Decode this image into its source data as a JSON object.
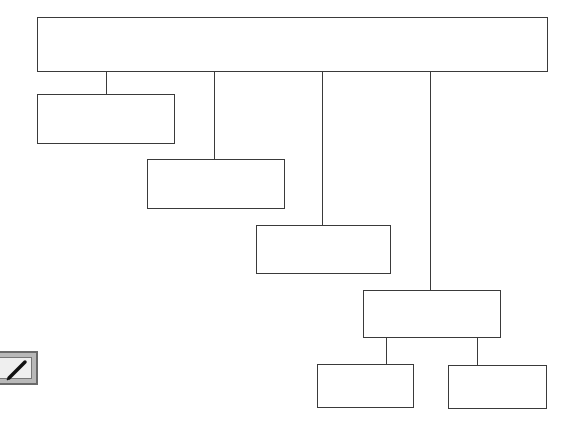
{
  "diagram": {
    "type": "hierarchy",
    "root": {
      "label": ""
    },
    "nodes": [
      {
        "id": "n1",
        "label": "",
        "parent": "root"
      },
      {
        "id": "n2",
        "label": "",
        "parent": "root"
      },
      {
        "id": "n3",
        "label": "",
        "parent": "root"
      },
      {
        "id": "n4",
        "label": "",
        "parent": "root"
      },
      {
        "id": "n5",
        "label": "",
        "parent": "n4"
      },
      {
        "id": "n6",
        "label": "",
        "parent": "n4"
      }
    ],
    "colors": {
      "line": "#3a3a3a",
      "fill": "#ffffff"
    }
  },
  "icon": {
    "name": "edit-screen-icon"
  }
}
